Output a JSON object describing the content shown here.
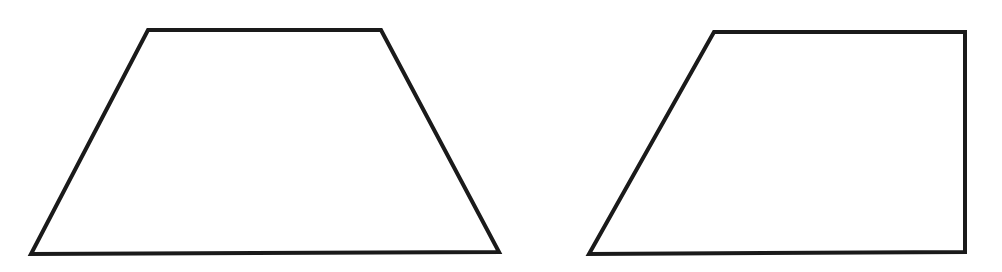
{
  "figure": {
    "background": "#ffffff",
    "stroke_color": "#1a1a1a",
    "stroke_width": 4,
    "shapes": [
      {
        "name": "isosceles-trapezoid",
        "type": "trapezoid",
        "points": "148,30 381,30 499,252 31,254"
      },
      {
        "name": "right-trapezoid",
        "type": "trapezoid",
        "points": "714,32 965,32 965,252 589,254"
      }
    ]
  }
}
